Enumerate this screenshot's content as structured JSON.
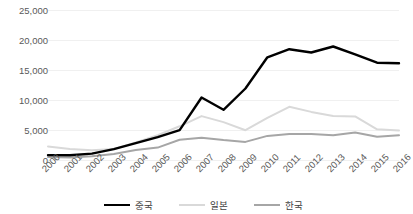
{
  "chart_data": {
    "type": "line",
    "title": "",
    "xlabel": "",
    "ylabel": "",
    "categories": [
      "2000",
      "2001",
      "2002",
      "2003",
      "2004",
      "2005",
      "2006",
      "2007",
      "2008",
      "2009",
      "2010",
      "2011",
      "2012",
      "2013",
      "2014",
      "2015",
      "2016"
    ],
    "ylim": [
      0,
      25000
    ],
    "yticks": [
      0,
      5000,
      10000,
      15000,
      20000,
      25000
    ],
    "ytick_labels": [
      "0",
      "5,000",
      "10,000",
      "15,000",
      "20,000",
      "25,000"
    ],
    "grid": true,
    "grid_axis": "y",
    "legend_position": "bottom",
    "series": [
      {
        "name": "중국",
        "color": "#000000",
        "width": 2.4,
        "values": [
          900,
          880,
          1150,
          1900,
          2900,
          3900,
          5050,
          10500,
          8450,
          12000,
          17200,
          18550,
          18000,
          19000,
          17700,
          16300,
          16200
        ]
      },
      {
        "name": "일본",
        "color": "#d9d9d9",
        "width": 2.0,
        "values": [
          2350,
          1900,
          1700,
          1900,
          3000,
          4200,
          5700,
          7400,
          6400,
          5050,
          7100,
          8950,
          8100,
          7400,
          7350,
          5200,
          5000
        ]
      },
      {
        "name": "한국",
        "color": "#a6a6a6",
        "width": 2.0,
        "values": [
          600,
          520,
          700,
          1100,
          1750,
          2150,
          3450,
          3800,
          3400,
          3100,
          4100,
          4400,
          4400,
          4200,
          4650,
          3950,
          4200
        ]
      }
    ]
  },
  "legend": {
    "items": [
      {
        "label": "중국",
        "color": "#000000",
        "width": 2.4
      },
      {
        "label": "일본",
        "color": "#d9d9d9",
        "width": 2.0
      },
      {
        "label": "한국",
        "color": "#a6a6a6",
        "width": 2.0
      }
    ]
  },
  "axes": {
    "grid_color": "#f0f0f0",
    "tick_label_color": "#595959"
  }
}
